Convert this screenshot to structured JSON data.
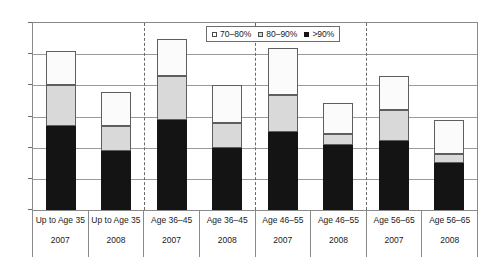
{
  "chart_data": {
    "type": "bar",
    "stacked": true,
    "title": "",
    "subtitle": "",
    "xlabel": "",
    "ylabel": "",
    "ylim": [
      0,
      60
    ],
    "ytick_labels": [
      "0%",
      "10%",
      "20%",
      "30%",
      "40%",
      "50%",
      "60%"
    ],
    "ytick_values": [
      0,
      10,
      20,
      30,
      40,
      50,
      60
    ],
    "grid": true,
    "legend_position": "top-center",
    "categories": [
      "Up to Age 35 2007",
      "Up to Age 35 2008",
      "Age 36–45 2007",
      "Age 36–45 2008",
      "Age 46–55 2007",
      "Age 46–55 2008",
      "Age 56–65 2007",
      "Age 56–65 2008"
    ],
    "group_labels": [
      "Up to Age 35",
      "Up to Age 35",
      "Age 36–45",
      "Age 36–45",
      "Age 46–55",
      "Age 46–55",
      "Age 56–65",
      "Age 56–65"
    ],
    "year_labels": [
      "2007",
      "2008",
      "2007",
      "2008",
      "2007",
      "2008",
      "2007",
      "2008"
    ],
    "series": [
      {
        "name": ">90%",
        "color": "#141414",
        "values": [
          27,
          19,
          29,
          20,
          25,
          21,
          22,
          15
        ]
      },
      {
        "name": "80–90%",
        "color": "#d9d9d9",
        "values": [
          13,
          8,
          14,
          8,
          12,
          3.5,
          10,
          3
        ]
      },
      {
        "name": "70–80%",
        "color": "#ffffff",
        "values": [
          11,
          11,
          12,
          12,
          15,
          10,
          11,
          11
        ]
      }
    ],
    "totals": [
      51,
      38,
      55,
      40,
      52,
      34.5,
      43,
      29
    ],
    "legend_entries": [
      "70–80%",
      "80–90%",
      ">90%"
    ],
    "group_separators": [
      2,
      4,
      6
    ]
  },
  "legend": {
    "items": [
      {
        "label": "70–80%",
        "swatch": "white-square-icon"
      },
      {
        "label": "80–90%",
        "swatch": "gray-square-icon"
      },
      {
        "label": ">90%",
        "swatch": "black-square-icon"
      }
    ]
  },
  "colors": {
    "segment_70_80": "#ffffff",
    "segment_80_90": "#d9d9d9",
    "segment_90_plus": "#141414",
    "gridline": "#9a9a9a",
    "frame": "#8a8a8a",
    "separator": "#6a6a6a"
  }
}
